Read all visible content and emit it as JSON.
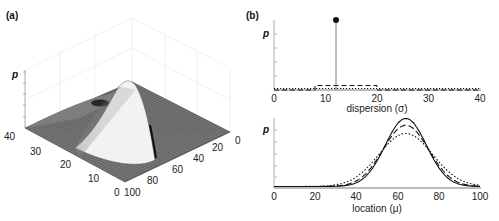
{
  "chart_data": [
    {
      "id": "a",
      "panel_label": "(a)",
      "type": "surface",
      "title": "",
      "zlabel": "p",
      "axis_sigma": {
        "ticks": [
          "0",
          "10",
          "20",
          "30",
          "40"
        ],
        "range": [
          0,
          40
        ]
      },
      "axis_mu": {
        "ticks": [
          "0",
          "20",
          "40",
          "60",
          "80",
          "100"
        ],
        "range": [
          0,
          100
        ]
      },
      "description": "Wireframe joint probability surface over location (mu) and dispersion (sigma), peaked near mu≈64, sigma≈12",
      "peak": {
        "mu": 64,
        "sigma": 12
      }
    },
    {
      "id": "b-top",
      "panel_label": "(b)",
      "type": "line",
      "xlabel": "dispersion (σ)",
      "ylabel": "p",
      "xlim": [
        0,
        40
      ],
      "xticks": [
        "0",
        "10",
        "20",
        "30",
        "40"
      ],
      "series": [
        {
          "name": "solid (point mass)",
          "style": "solid",
          "x": [
            12
          ],
          "values": [
            1.0
          ]
        },
        {
          "name": "dashed (uniform)",
          "style": "dashed",
          "x": [
            0,
            8,
            8,
            20,
            20,
            40
          ],
          "values": [
            0.0,
            0.0,
            0.08,
            0.08,
            0.0,
            0.0
          ]
        },
        {
          "name": "dotted (flat)",
          "style": "dotted",
          "x": [
            0,
            40
          ],
          "values": [
            0.02,
            0.02
          ]
        }
      ]
    },
    {
      "id": "b-bottom",
      "type": "line",
      "xlabel": "location (μ)",
      "ylabel": "p",
      "xlim": [
        0,
        100
      ],
      "xticks": [
        "0",
        "20",
        "40",
        "60",
        "80",
        "100"
      ],
      "series": [
        {
          "name": "solid",
          "style": "solid",
          "mean": 64,
          "sd": 10,
          "peak": 1.0
        },
        {
          "name": "dashed",
          "style": "dashed",
          "mean": 64,
          "sd": 11,
          "peak": 0.9
        },
        {
          "name": "dotted",
          "style": "dotted",
          "mean": 64,
          "sd": 13,
          "peak": 0.78
        }
      ]
    }
  ],
  "labels": {
    "panel_a": "(a)",
    "panel_b": "(b)",
    "p": "p",
    "dispersion": "dispersion (σ)",
    "location": "location (μ)",
    "sigma_ticks": [
      "0",
      "10",
      "20",
      "30",
      "40"
    ],
    "mu_ticks": [
      "0",
      "20",
      "40",
      "60",
      "80",
      "100"
    ],
    "surf_sigma_ticks": [
      "0",
      "10",
      "20",
      "30",
      "40"
    ],
    "surf_mu_ticks": [
      "0",
      "20",
      "40",
      "60",
      "80",
      "100"
    ]
  }
}
